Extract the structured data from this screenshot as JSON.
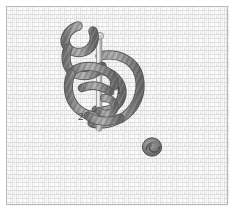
{
  "figure": {
    "kind": "needlework-stitch-diagram",
    "width_px": 235,
    "height_px": 212
  },
  "fabric": {
    "name": "basketweave-canvas",
    "pattern": "basket weave",
    "block_length_px": 12,
    "block_width_px": 4,
    "repeat_px": 16,
    "thread_line_color": "#d6d6d6",
    "block_fill_color": "#fbfbfb",
    "ground_color": "#fdfdfd",
    "border_color": "#b9b9b9"
  },
  "cord": {
    "name": "embroidery-cord",
    "color": "#8a8a8a",
    "highlight_color": "#b5b5b5",
    "shadow_color": "#5f5f5f",
    "width_px": 7,
    "twist": "s-twist"
  },
  "needle": {
    "name": "tapestry-needle",
    "shaft_color": "#d9d9d9",
    "shaft_edge_color": "#9a9a9a",
    "eye_color": "#c6c6c6",
    "top_y": 32,
    "bottom_y": 131,
    "x": 100
  },
  "labels": [
    {
      "id": "1",
      "text": "1",
      "meaning": "first pass of the cord",
      "x": 116,
      "y": 85
    },
    {
      "id": "2",
      "text": "2",
      "meaning": "second pass of the cord",
      "x": 78,
      "y": 111
    }
  ],
  "worked_knot": {
    "name": "completed-knot",
    "x": 152,
    "y": 147,
    "diameter_px": 18,
    "color": "#7d7d7d"
  }
}
